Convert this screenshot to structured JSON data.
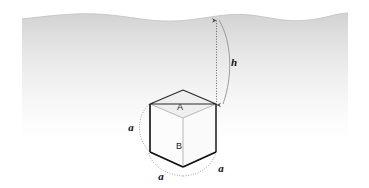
{
  "figure": {
    "background_color": "#ffffff",
    "water": {
      "name": "water-body",
      "top_color": "#d2d2d2",
      "bottom_color": "#ffffff",
      "surface_line_color": "#c9c9c9",
      "surface_top_y": 14,
      "fade_bottom_y": 132
    },
    "cube": {
      "label_top_face": "A",
      "label_bottom_face": "B",
      "edge_color_front": "#1a1a1a",
      "edge_color_back": "#9a9a9a",
      "face_fill": "#fbfbfb",
      "top_face_fill": "#f0f0f0"
    },
    "dimensions": {
      "depth_label": "h",
      "edge_label_left": "a",
      "edge_label_bottom_left": "a",
      "edge_label_bottom_right": "a",
      "leader_color": "#4a4a4a",
      "arc_color": "#8a8a8a"
    }
  }
}
